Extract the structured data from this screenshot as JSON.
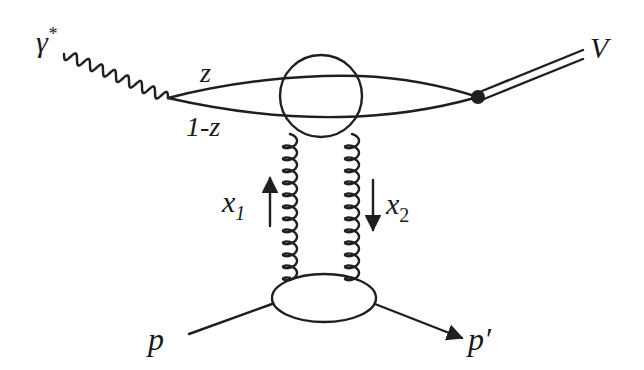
{
  "diagram": {
    "type": "feynman-diagram",
    "colors": {
      "ink": "#1f1f1f",
      "background": "#ffffff"
    },
    "labels": {
      "photon": "γ",
      "photon_sup": "*",
      "quark_upper": "z",
      "quark_lower": "1-z",
      "vector_meson": "V",
      "gluon_left": "x",
      "gluon_left_sub": "1",
      "gluon_right": "x",
      "gluon_right_sub": "2",
      "proton_in": "p",
      "proton_out": "p′"
    },
    "nodes": [
      {
        "id": "photon-quark-vertex",
        "label": ""
      },
      {
        "id": "quark-loop-blob",
        "label": ""
      },
      {
        "id": "meson-vertex",
        "label": ""
      },
      {
        "id": "proton-blob",
        "label": ""
      }
    ],
    "edges": [
      {
        "from": "γ*",
        "to": "photon-quark-vertex",
        "style": "wavy"
      },
      {
        "from": "photon-quark-vertex",
        "to": "meson-vertex",
        "label": "z",
        "style": "solid"
      },
      {
        "from": "photon-quark-vertex",
        "to": "meson-vertex",
        "label": "1-z",
        "style": "solid"
      },
      {
        "from": "meson-vertex",
        "to": "V",
        "style": "double"
      },
      {
        "from": "proton-blob",
        "to": "quark-loop-blob",
        "label": "x1",
        "style": "gluon"
      },
      {
        "from": "quark-loop-blob",
        "to": "proton-blob",
        "label": "x2",
        "style": "gluon"
      },
      {
        "from": "p",
        "to": "proton-blob",
        "style": "solid"
      },
      {
        "from": "proton-blob",
        "to": "p′",
        "style": "arrow"
      }
    ]
  }
}
